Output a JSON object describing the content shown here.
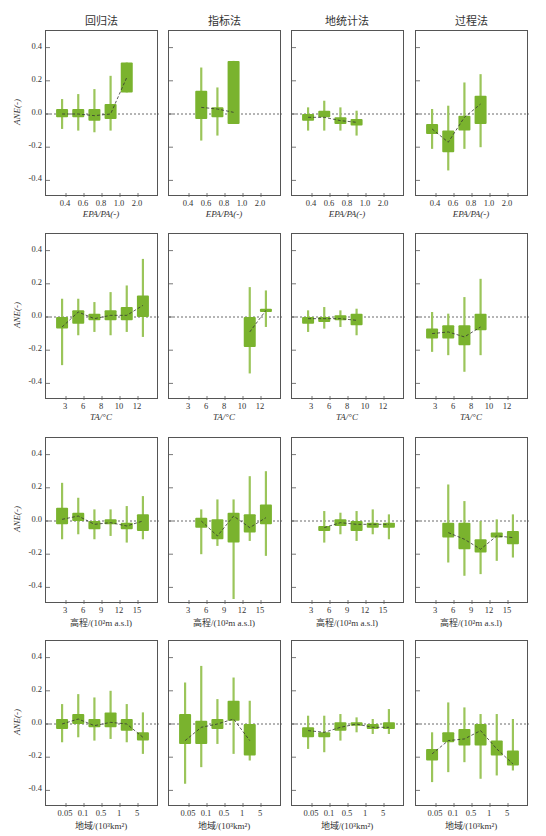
{
  "column_titles": [
    "回归法",
    "指标法",
    "地统计法",
    "过程法"
  ],
  "y_axis": {
    "label": "ANE(-)",
    "ticks": [
      "0.4",
      "0.2",
      "0.0",
      "-0.2",
      "-0.4"
    ],
    "tick_values": [
      0.4,
      0.2,
      0.0,
      -0.2,
      -0.4
    ],
    "ylim": [
      -0.5,
      0.5
    ]
  },
  "rows": [
    {
      "xlabel": "E_PA/P_A(-)",
      "xlabel_display": "EPA/PA(-)",
      "xticks": [
        "0.4",
        "0.6",
        "0.8",
        "1.0",
        "2.0"
      ]
    },
    {
      "xlabel": "T_A/°C",
      "xlabel_display": "TA/°C",
      "xticks": [
        "3",
        "6",
        "8",
        "10",
        "12"
      ]
    },
    {
      "xlabel": "高程/(10²m a.s.l)",
      "xlabel_display": "高程/(10²m a.s.l)",
      "xticks": [
        "3",
        "6",
        "9",
        "12",
        "15"
      ]
    },
    {
      "xlabel": "地域/(10³km²)",
      "xlabel_display": "地域/(10³km²)",
      "xticks": [
        "0.05",
        "0.1",
        "0.5",
        "1",
        "5"
      ]
    }
  ],
  "colors": {
    "box": "#7ab32e",
    "whisker": "#9bc55a",
    "median_line": "#333333",
    "zero_line": "#444444",
    "frame": "#555555"
  },
  "chart_data": {
    "type": "boxplot-grid",
    "title": "",
    "ylabel": "ANE(-)",
    "ylim": [
      -0.5,
      0.5
    ],
    "grid": false,
    "legend": "none",
    "columns": [
      "回归法",
      "指标法",
      "地统计法",
      "过程法"
    ],
    "panels": [
      {
        "row": 0,
        "col": 0,
        "xlabel": "EPA/PA(-)",
        "boxes": [
          {
            "pos": 0,
            "q1": -0.02,
            "q3": 0.03,
            "lo": -0.09,
            "hi": 0.09,
            "med": 0.0
          },
          {
            "pos": 1,
            "q1": -0.02,
            "q3": 0.03,
            "lo": -0.1,
            "hi": 0.12,
            "med": 0.0
          },
          {
            "pos": 2,
            "q1": -0.04,
            "q3": 0.03,
            "lo": -0.11,
            "hi": 0.15,
            "med": -0.01
          },
          {
            "pos": 3,
            "q1": -0.03,
            "q3": 0.06,
            "lo": -0.1,
            "hi": 0.23,
            "med": 0.0
          },
          {
            "pos": 4,
            "q1": 0.13,
            "q3": 0.31,
            "lo": 0.13,
            "hi": 0.31,
            "med": 0.22
          }
        ]
      },
      {
        "row": 0,
        "col": 1,
        "xlabel": "EPA/PA(-)",
        "boxes": [
          {
            "pos": 1,
            "q1": -0.03,
            "q3": 0.14,
            "lo": -0.16,
            "hi": 0.28,
            "med": 0.04
          },
          {
            "pos": 2,
            "q1": -0.02,
            "q3": 0.04,
            "lo": -0.13,
            "hi": 0.16,
            "med": 0.03
          },
          {
            "pos": 3,
            "q1": -0.06,
            "q3": 0.32,
            "lo": -0.06,
            "hi": 0.32,
            "med": 0.01
          }
        ]
      },
      {
        "row": 0,
        "col": 2,
        "xlabel": "EPA/PA(-)",
        "boxes": [
          {
            "pos": 0,
            "q1": -0.04,
            "q3": 0.0,
            "lo": -0.1,
            "hi": 0.04,
            "med": -0.02
          },
          {
            "pos": 1,
            "q1": -0.02,
            "q3": 0.02,
            "lo": -0.1,
            "hi": 0.08,
            "med": -0.02
          },
          {
            "pos": 2,
            "q1": -0.06,
            "q3": -0.02,
            "lo": -0.1,
            "hi": 0.04,
            "med": -0.04
          },
          {
            "pos": 3,
            "q1": -0.07,
            "q3": -0.03,
            "lo": -0.13,
            "hi": 0.02,
            "med": -0.05
          }
        ]
      },
      {
        "row": 0,
        "col": 3,
        "xlabel": "EPA/PA(-)",
        "boxes": [
          {
            "pos": 0,
            "q1": -0.12,
            "q3": -0.06,
            "lo": -0.21,
            "hi": 0.03,
            "med": -0.09
          },
          {
            "pos": 1,
            "q1": -0.23,
            "q3": -0.1,
            "lo": -0.34,
            "hi": 0.05,
            "med": -0.17
          },
          {
            "pos": 2,
            "q1": -0.1,
            "q3": -0.01,
            "lo": -0.21,
            "hi": 0.19,
            "med": -0.02
          },
          {
            "pos": 3,
            "q1": -0.06,
            "q3": 0.11,
            "lo": -0.2,
            "hi": 0.24,
            "med": 0.06
          }
        ]
      },
      {
        "row": 1,
        "col": 0,
        "xlabel": "TA/°C",
        "boxes": [
          {
            "pos": 0,
            "q1": -0.07,
            "q3": 0.0,
            "lo": -0.29,
            "hi": 0.11,
            "med": -0.06
          },
          {
            "pos": 1,
            "q1": -0.04,
            "q3": 0.04,
            "lo": -0.11,
            "hi": 0.11,
            "med": 0.03
          },
          {
            "pos": 2,
            "q1": -0.02,
            "q3": 0.02,
            "lo": -0.09,
            "hi": 0.09,
            "med": -0.01
          },
          {
            "pos": 3,
            "q1": -0.02,
            "q3": 0.04,
            "lo": -0.11,
            "hi": 0.15,
            "med": 0.01
          },
          {
            "pos": 4,
            "q1": -0.02,
            "q3": 0.06,
            "lo": -0.09,
            "hi": 0.19,
            "med": 0.01
          },
          {
            "pos": 5,
            "q1": 0.0,
            "q3": 0.13,
            "lo": -0.12,
            "hi": 0.35,
            "med": 0.07
          }
        ]
      },
      {
        "row": 1,
        "col": 1,
        "xlabel": "TA/°C",
        "boxes": [
          {
            "pos": 4,
            "q1": -0.18,
            "q3": 0.0,
            "lo": -0.34,
            "hi": 0.18,
            "med": -0.09
          },
          {
            "pos": 5,
            "q1": 0.03,
            "q3": 0.05,
            "lo": -0.06,
            "hi": 0.16,
            "med": 0.04
          }
        ]
      },
      {
        "row": 1,
        "col": 2,
        "xlabel": "TA/°C",
        "boxes": [
          {
            "pos": 0,
            "q1": -0.04,
            "q3": 0.0,
            "lo": -0.09,
            "hi": 0.04,
            "med": -0.01
          },
          {
            "pos": 1,
            "q1": -0.03,
            "q3": 0.0,
            "lo": -0.07,
            "hi": 0.06,
            "med": -0.01
          },
          {
            "pos": 2,
            "q1": -0.02,
            "q3": 0.01,
            "lo": -0.06,
            "hi": 0.04,
            "med": -0.01
          },
          {
            "pos": 3,
            "q1": -0.05,
            "q3": 0.02,
            "lo": -0.11,
            "hi": 0.05,
            "med": -0.02
          }
        ]
      },
      {
        "row": 1,
        "col": 3,
        "xlabel": "TA/°C",
        "boxes": [
          {
            "pos": 0,
            "q1": -0.13,
            "q3": -0.07,
            "lo": -0.21,
            "hi": 0.03,
            "med": -0.1
          },
          {
            "pos": 1,
            "q1": -0.13,
            "q3": -0.05,
            "lo": -0.23,
            "hi": 0.02,
            "med": -0.09
          },
          {
            "pos": 2,
            "q1": -0.17,
            "q3": -0.05,
            "lo": -0.33,
            "hi": 0.12,
            "med": -0.12
          },
          {
            "pos": 3,
            "q1": -0.08,
            "q3": 0.02,
            "lo": -0.23,
            "hi": 0.23,
            "med": -0.06
          }
        ]
      },
      {
        "row": 2,
        "col": 0,
        "xlabel": "高程/(10²m a.s.l)",
        "boxes": [
          {
            "pos": 0,
            "q1": -0.02,
            "q3": 0.08,
            "lo": -0.11,
            "hi": 0.23,
            "med": 0.01
          },
          {
            "pos": 1,
            "q1": 0.0,
            "q3": 0.05,
            "lo": -0.08,
            "hi": 0.14,
            "med": 0.03
          },
          {
            "pos": 2,
            "q1": -0.05,
            "q3": 0.0,
            "lo": -0.11,
            "hi": 0.07,
            "med": -0.02
          },
          {
            "pos": 3,
            "q1": -0.02,
            "q3": 0.01,
            "lo": -0.09,
            "hi": 0.07,
            "med": -0.01
          },
          {
            "pos": 4,
            "q1": -0.05,
            "q3": -0.01,
            "lo": -0.13,
            "hi": 0.09,
            "med": -0.03
          },
          {
            "pos": 5,
            "q1": -0.06,
            "q3": 0.04,
            "lo": -0.11,
            "hi": 0.15,
            "med": 0.0
          }
        ]
      },
      {
        "row": 2,
        "col": 1,
        "xlabel": "高程/(10²m a.s.l)",
        "boxes": [
          {
            "pos": 1,
            "q1": -0.04,
            "q3": 0.02,
            "lo": -0.2,
            "hi": 0.07,
            "med": 0.0
          },
          {
            "pos": 2,
            "q1": -0.11,
            "q3": 0.01,
            "lo": -0.15,
            "hi": 0.13,
            "med": -0.09
          },
          {
            "pos": 3,
            "q1": -0.13,
            "q3": 0.05,
            "lo": -0.47,
            "hi": 0.13,
            "med": 0.03
          },
          {
            "pos": 4,
            "q1": -0.07,
            "q3": 0.04,
            "lo": -0.12,
            "hi": 0.27,
            "med": -0.04
          },
          {
            "pos": 5,
            "q1": -0.02,
            "q3": 0.1,
            "lo": -0.21,
            "hi": 0.3,
            "med": 0.02
          }
        ]
      },
      {
        "row": 2,
        "col": 2,
        "xlabel": "高程/(10²m a.s.l)",
        "boxes": [
          {
            "pos": 1,
            "q1": -0.06,
            "q3": -0.03,
            "lo": -0.13,
            "hi": 0.06,
            "med": -0.04
          },
          {
            "pos": 2,
            "q1": -0.03,
            "q3": 0.01,
            "lo": -0.08,
            "hi": 0.05,
            "med": -0.01
          },
          {
            "pos": 3,
            "q1": -0.06,
            "q3": 0.0,
            "lo": -0.12,
            "hi": 0.06,
            "med": -0.02
          },
          {
            "pos": 4,
            "q1": -0.04,
            "q3": -0.01,
            "lo": -0.08,
            "hi": 0.07,
            "med": -0.02
          },
          {
            "pos": 5,
            "q1": -0.04,
            "q3": -0.01,
            "lo": -0.11,
            "hi": 0.04,
            "med": -0.02
          }
        ]
      },
      {
        "row": 2,
        "col": 3,
        "xlabel": "高程/(10²m a.s.l)",
        "boxes": [
          {
            "pos": 1,
            "q1": -0.1,
            "q3": -0.01,
            "lo": -0.25,
            "hi": 0.22,
            "med": -0.07
          },
          {
            "pos": 2,
            "q1": -0.17,
            "q3": -0.01,
            "lo": -0.33,
            "hi": 0.12,
            "med": -0.11
          },
          {
            "pos": 3,
            "q1": -0.19,
            "q3": -0.11,
            "lo": -0.32,
            "hi": 0.0,
            "med": -0.17
          },
          {
            "pos": 4,
            "q1": -0.1,
            "q3": -0.07,
            "lo": -0.24,
            "hi": 0.01,
            "med": -0.09
          },
          {
            "pos": 5,
            "q1": -0.14,
            "q3": -0.06,
            "lo": -0.22,
            "hi": 0.04,
            "med": -0.1
          }
        ]
      },
      {
        "row": 3,
        "col": 0,
        "xlabel": "地域/(10³km²)",
        "boxes": [
          {
            "pos": 0,
            "q1": -0.03,
            "q3": 0.03,
            "lo": -0.11,
            "hi": 0.12,
            "med": 0.0
          },
          {
            "pos": 1,
            "q1": 0.0,
            "q3": 0.06,
            "lo": -0.08,
            "hi": 0.18,
            "med": 0.03
          },
          {
            "pos": 2,
            "q1": -0.02,
            "q3": 0.03,
            "lo": -0.1,
            "hi": 0.16,
            "med": -0.01
          },
          {
            "pos": 3,
            "q1": -0.02,
            "q3": 0.07,
            "lo": -0.09,
            "hi": 0.2,
            "med": 0.01
          },
          {
            "pos": 4,
            "q1": -0.04,
            "q3": 0.03,
            "lo": -0.11,
            "hi": 0.12,
            "med": 0.0
          },
          {
            "pos": 5,
            "q1": -0.1,
            "q3": -0.05,
            "lo": -0.18,
            "hi": 0.07,
            "med": -0.08
          }
        ]
      },
      {
        "row": 3,
        "col": 1,
        "xlabel": "地域/(10³km²)",
        "boxes": [
          {
            "pos": 0,
            "q1": -0.12,
            "q3": 0.06,
            "lo": -0.36,
            "hi": 0.25,
            "med": -0.1
          },
          {
            "pos": 1,
            "q1": -0.12,
            "q3": 0.02,
            "lo": -0.26,
            "hi": 0.35,
            "med": -0.02
          },
          {
            "pos": 2,
            "q1": -0.03,
            "q3": 0.03,
            "lo": -0.12,
            "hi": 0.15,
            "med": 0.0
          },
          {
            "pos": 3,
            "q1": 0.02,
            "q3": 0.14,
            "lo": -0.18,
            "hi": 0.28,
            "med": 0.03
          },
          {
            "pos": 4,
            "q1": -0.19,
            "q3": 0.0,
            "lo": -0.22,
            "hi": 0.14,
            "med": -0.1
          }
        ]
      },
      {
        "row": 3,
        "col": 2,
        "xlabel": "地域/(10³km²)",
        "boxes": [
          {
            "pos": 0,
            "q1": -0.08,
            "q3": -0.02,
            "lo": -0.15,
            "hi": 0.05,
            "med": -0.04
          },
          {
            "pos": 1,
            "q1": -0.08,
            "q3": -0.05,
            "lo": -0.17,
            "hi": 0.05,
            "med": -0.05
          },
          {
            "pos": 2,
            "q1": -0.04,
            "q3": 0.01,
            "lo": -0.1,
            "hi": 0.06,
            "med": -0.02
          },
          {
            "pos": 3,
            "q1": -0.01,
            "q3": 0.01,
            "lo": -0.05,
            "hi": 0.04,
            "med": 0.0
          },
          {
            "pos": 4,
            "q1": -0.03,
            "q3": 0.0,
            "lo": -0.06,
            "hi": 0.03,
            "med": -0.02
          },
          {
            "pos": 5,
            "q1": -0.03,
            "q3": 0.01,
            "lo": -0.06,
            "hi": 0.09,
            "med": -0.02
          }
        ]
      },
      {
        "row": 3,
        "col": 3,
        "xlabel": "地域/(10³km²)",
        "boxes": [
          {
            "pos": 0,
            "q1": -0.22,
            "q3": -0.15,
            "lo": -0.35,
            "hi": -0.05,
            "med": -0.18
          },
          {
            "pos": 1,
            "q1": -0.11,
            "q3": -0.05,
            "lo": -0.29,
            "hi": 0.13,
            "med": -0.1
          },
          {
            "pos": 2,
            "q1": -0.13,
            "q3": -0.03,
            "lo": -0.23,
            "hi": 0.1,
            "med": -0.09
          },
          {
            "pos": 3,
            "q1": -0.13,
            "q3": 0.0,
            "lo": -0.33,
            "hi": 0.06,
            "med": -0.04
          },
          {
            "pos": 4,
            "q1": -0.19,
            "q3": -0.1,
            "lo": -0.31,
            "hi": 0.06,
            "med": -0.15
          },
          {
            "pos": 5,
            "q1": -0.25,
            "q3": -0.16,
            "lo": -0.28,
            "hi": 0.03,
            "med": -0.24
          }
        ]
      }
    ]
  }
}
